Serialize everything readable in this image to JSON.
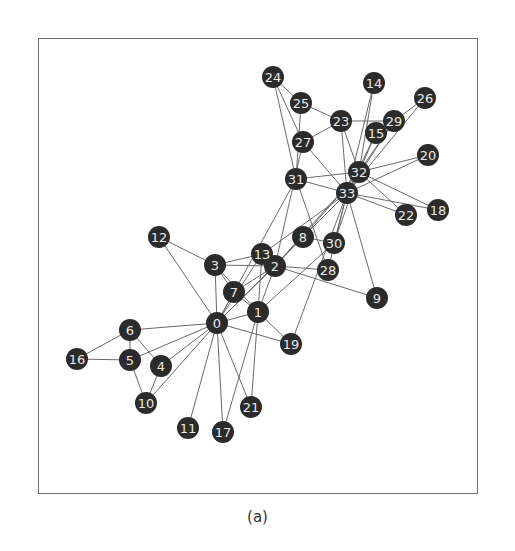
{
  "caption": "(a)",
  "graph": {
    "name": "Zachary karate club network",
    "node_radius": 11,
    "node_color": "#2b2b2b",
    "label_color": "#e8e8e8",
    "edge_color": "#6a6a6a",
    "nodes": [
      {
        "id": "0",
        "x": 217,
        "y": 323
      },
      {
        "id": "1",
        "x": 258,
        "y": 312
      },
      {
        "id": "2",
        "x": 275,
        "y": 266
      },
      {
        "id": "3",
        "x": 215,
        "y": 265
      },
      {
        "id": "4",
        "x": 161,
        "y": 366
      },
      {
        "id": "5",
        "x": 130,
        "y": 360
      },
      {
        "id": "6",
        "x": 130,
        "y": 330
      },
      {
        "id": "7",
        "x": 234,
        "y": 292
      },
      {
        "id": "8",
        "x": 303,
        "y": 237
      },
      {
        "id": "9",
        "x": 377,
        "y": 298
      },
      {
        "id": "10",
        "x": 146,
        "y": 403
      },
      {
        "id": "11",
        "x": 188,
        "y": 428
      },
      {
        "id": "12",
        "x": 159,
        "y": 237
      },
      {
        "id": "13",
        "x": 262,
        "y": 254
      },
      {
        "id": "14",
        "x": 374,
        "y": 83
      },
      {
        "id": "15",
        "x": 376,
        "y": 133
      },
      {
        "id": "16",
        "x": 77,
        "y": 359
      },
      {
        "id": "17",
        "x": 223,
        "y": 432
      },
      {
        "id": "18",
        "x": 438,
        "y": 210
      },
      {
        "id": "19",
        "x": 291,
        "y": 344
      },
      {
        "id": "20",
        "x": 428,
        "y": 155
      },
      {
        "id": "21",
        "x": 251,
        "y": 407
      },
      {
        "id": "22",
        "x": 406,
        "y": 215
      },
      {
        "id": "23",
        "x": 341,
        "y": 121
      },
      {
        "id": "24",
        "x": 273,
        "y": 77
      },
      {
        "id": "25",
        "x": 301,
        "y": 103
      },
      {
        "id": "26",
        "x": 425,
        "y": 98
      },
      {
        "id": "27",
        "x": 303,
        "y": 142
      },
      {
        "id": "28",
        "x": 328,
        "y": 270
      },
      {
        "id": "29",
        "x": 394,
        "y": 121
      },
      {
        "id": "30",
        "x": 334,
        "y": 243
      },
      {
        "id": "31",
        "x": 296,
        "y": 179
      },
      {
        "id": "32",
        "x": 359,
        "y": 172
      },
      {
        "id": "33",
        "x": 347,
        "y": 193
      }
    ],
    "edges": [
      [
        0,
        1
      ],
      [
        0,
        2
      ],
      [
        0,
        3
      ],
      [
        0,
        4
      ],
      [
        0,
        5
      ],
      [
        0,
        6
      ],
      [
        0,
        7
      ],
      [
        0,
        8
      ],
      [
        0,
        10
      ],
      [
        0,
        11
      ],
      [
        0,
        12
      ],
      [
        0,
        13
      ],
      [
        0,
        17
      ],
      [
        0,
        19
      ],
      [
        0,
        21
      ],
      [
        0,
        31
      ],
      [
        1,
        2
      ],
      [
        1,
        3
      ],
      [
        1,
        7
      ],
      [
        1,
        13
      ],
      [
        1,
        17
      ],
      [
        1,
        19
      ],
      [
        1,
        21
      ],
      [
        1,
        30
      ],
      [
        2,
        3
      ],
      [
        2,
        7
      ],
      [
        2,
        8
      ],
      [
        2,
        9
      ],
      [
        2,
        13
      ],
      [
        2,
        27
      ],
      [
        2,
        28
      ],
      [
        2,
        32
      ],
      [
        3,
        7
      ],
      [
        3,
        12
      ],
      [
        3,
        13
      ],
      [
        4,
        6
      ],
      [
        4,
        10
      ],
      [
        5,
        6
      ],
      [
        5,
        10
      ],
      [
        5,
        16
      ],
      [
        6,
        16
      ],
      [
        8,
        30
      ],
      [
        8,
        32
      ],
      [
        8,
        33
      ],
      [
        9,
        33
      ],
      [
        13,
        33
      ],
      [
        14,
        32
      ],
      [
        14,
        33
      ],
      [
        15,
        32
      ],
      [
        15,
        33
      ],
      [
        18,
        32
      ],
      [
        18,
        33
      ],
      [
        19,
        33
      ],
      [
        20,
        32
      ],
      [
        20,
        33
      ],
      [
        22,
        32
      ],
      [
        22,
        33
      ],
      [
        23,
        25
      ],
      [
        23,
        27
      ],
      [
        23,
        29
      ],
      [
        23,
        32
      ],
      [
        23,
        33
      ],
      [
        24,
        25
      ],
      [
        24,
        27
      ],
      [
        24,
        31
      ],
      [
        25,
        31
      ],
      [
        26,
        29
      ],
      [
        26,
        33
      ],
      [
        27,
        33
      ],
      [
        28,
        31
      ],
      [
        28,
        33
      ],
      [
        29,
        32
      ],
      [
        29,
        33
      ],
      [
        30,
        32
      ],
      [
        30,
        33
      ],
      [
        31,
        32
      ],
      [
        31,
        33
      ],
      [
        32,
        33
      ]
    ]
  }
}
